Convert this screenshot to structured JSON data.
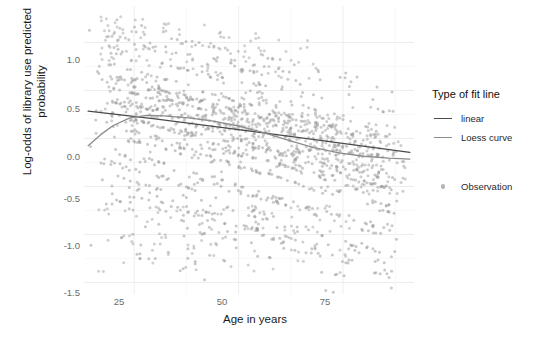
{
  "chart_data": {
    "type": "scatter",
    "title": "",
    "xlabel": "Age in years",
    "ylabel": "Log-odds of library use predicted\nprobability",
    "xlim": [
      13,
      92
    ],
    "ylim": [
      -1.62,
      1.38
    ],
    "xticks": [
      25,
      50,
      75
    ],
    "xticklabels": [
      "25",
      "50",
      "75"
    ],
    "yticks": [
      1.0,
      0.5,
      0.0,
      -0.5,
      -1.0,
      -1.5
    ],
    "yticklabels": [
      "1.0",
      "0.5",
      "0.0",
      "-0.5",
      "-1.0",
      "-1.5"
    ],
    "grid": true,
    "grid_color": "#ebebeb",
    "panel_background": "#ffffff",
    "point_color": "#9d9d9d",
    "point_opacity": 0.55,
    "point_size": 3.0,
    "legend_position": "right",
    "series": [
      {
        "name": "Observation",
        "type": "scatter",
        "marker": "circle",
        "color": "#9d9d9d",
        "n_points": 1600,
        "x_range": [
          14,
          91
        ],
        "y_range": [
          -1.45,
          1.32
        ],
        "description": "Dense cloud of semi-transparent grey points arranged in many overlapping descending diagonal bands; density highest between ages 18 and 60 and between log-odds -1.0 and 1.2, thinning toward the upper-right and lower-right."
      },
      {
        "name": "linear",
        "type": "line",
        "color": "#4a4a4a",
        "width": 1.3,
        "points": [
          [
            14,
            0.285
          ],
          [
            30,
            0.205
          ],
          [
            50,
            0.093
          ],
          [
            70,
            -0.022
          ],
          [
            91,
            -0.145
          ]
        ],
        "description": "Straight negative-slope fit from about +0.29 at age 14 down to about -0.15 at age 91."
      },
      {
        "name": "Loess curve",
        "type": "line",
        "color": "#8c8c8c",
        "width": 1.3,
        "points": [
          [
            14,
            -0.075
          ],
          [
            17,
            0.04
          ],
          [
            20,
            0.135
          ],
          [
            24,
            0.215
          ],
          [
            28,
            0.24
          ],
          [
            32,
            0.235
          ],
          [
            38,
            0.215
          ],
          [
            44,
            0.18
          ],
          [
            50,
            0.13
          ],
          [
            56,
            0.06
          ],
          [
            62,
            -0.02
          ],
          [
            68,
            -0.095
          ],
          [
            74,
            -0.15
          ],
          [
            80,
            -0.185
          ],
          [
            86,
            -0.205
          ],
          [
            91,
            -0.215
          ]
        ],
        "description": "Loess smoother rising steeply from about -0.08 at age 14 to a peak near +0.24 around age 29, then declining steadily to about -0.22 by age 91; crosses the linear fit near age 21 and again near age 57."
      }
    ],
    "legend": {
      "title": "Type of fit line",
      "line_entries": [
        {
          "label": "linear",
          "color": "#4a4a4a"
        },
        {
          "label": "Loess curve",
          "color": "#8c8c8c"
        }
      ],
      "point_entries": [
        {
          "label": "Observation",
          "color": "#b4b4b4"
        }
      ]
    }
  }
}
